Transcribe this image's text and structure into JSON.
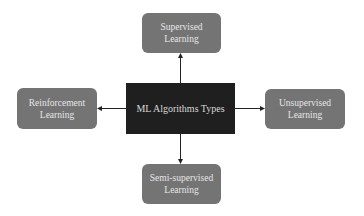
{
  "diagram": {
    "center": {
      "label": "ML Algorithms Types"
    },
    "nodes": [
      {
        "id": "top",
        "line1": "Supervised",
        "line2": "Learning"
      },
      {
        "id": "right",
        "line1": "Unsupervised",
        "line2": "Learning"
      },
      {
        "id": "bottom",
        "line1": "Semi-supervised",
        "line2": "Learning"
      },
      {
        "id": "left",
        "line1": "Reinforcement",
        "line2": "Learning"
      }
    ],
    "edges": [
      {
        "from": "center",
        "to": "top"
      },
      {
        "from": "center",
        "to": "right"
      },
      {
        "from": "center",
        "to": "bottom"
      },
      {
        "from": "center",
        "to": "left"
      }
    ],
    "colors": {
      "outer_fill": "#747474",
      "center_fill": "#1f1f1f",
      "text": "#e6e6e6",
      "edge": "#222222"
    }
  }
}
